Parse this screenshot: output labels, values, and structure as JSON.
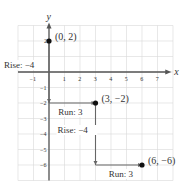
{
  "chart_data": {
    "type": "line",
    "title": "",
    "xlabel": "x",
    "ylabel": "y",
    "xlim": [
      -2,
      7.5
    ],
    "ylim": [
      -7,
      3
    ],
    "grid": true,
    "x_ticks": [
      -1,
      1,
      2,
      3,
      4,
      5,
      6,
      7
    ],
    "y_ticks": [
      2,
      -1,
      -2,
      -3,
      -4,
      -5,
      -6
    ],
    "points": [
      {
        "x": 0,
        "y": 2,
        "label": "(0, 2)"
      },
      {
        "x": 3,
        "y": -2,
        "label": "(3, −2)"
      },
      {
        "x": 6,
        "y": -6,
        "label": "(6, −6)"
      }
    ],
    "segments": [
      {
        "from": [
          0,
          2
        ],
        "to": [
          0,
          -2
        ],
        "type": "rise",
        "label": "Rise: −4"
      },
      {
        "from": [
          0,
          -2
        ],
        "to": [
          3,
          -2
        ],
        "type": "run",
        "label": "Run: 3"
      },
      {
        "from": [
          3,
          -2
        ],
        "to": [
          3,
          -6
        ],
        "type": "rise",
        "label": "Rise: −4"
      },
      {
        "from": [
          3,
          -6
        ],
        "to": [
          6,
          -6
        ],
        "type": "run",
        "label": "Run: 3"
      }
    ],
    "annotations": [
      "Rise: −4",
      "Run: 3",
      "Rise: −4",
      "Run: 3"
    ],
    "colors": {
      "grid": "#d8d8d8",
      "axis": "#555555",
      "path": "#666666",
      "point": "#111111"
    }
  }
}
